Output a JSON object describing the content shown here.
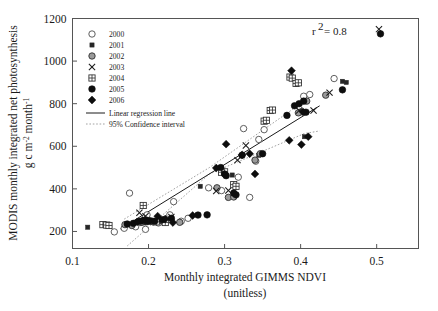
{
  "chart_data": {
    "type": "scatter",
    "title": "",
    "xlabel": "Monthly integrated GIMMS NDVI",
    "xlabel_sub": "(unitless)",
    "ylabel_line1": "MODIS monthly integrated net photosynthesis",
    "ylabel_line2": "g c m",
    "ylabel_exp1": "-2",
    "ylabel_line3": " month",
    "ylabel_exp2": "-1",
    "xlim": [
      0.1,
      0.555
    ],
    "ylim": [
      120,
      1200
    ],
    "xticks": [
      0.1,
      0.2,
      0.3,
      0.4,
      0.5
    ],
    "xticklabels": [
      "0.1",
      "0.2",
      "0.3",
      "0.4",
      "0.5"
    ],
    "yticks": [
      200,
      400,
      600,
      800,
      1000,
      1200
    ],
    "yticklabels": [
      "200",
      "400",
      "600",
      "800",
      "1000",
      "1200"
    ],
    "grid": false,
    "legend_position": "upper-left",
    "annotation": "r  = 0.8",
    "annotation_r": "r",
    "annotation_exp": "2",
    "annotation_eq": "= 0.8",
    "regression": {
      "label": "Linear regression line",
      "x0": 0.163,
      "y0": 212,
      "x1": 0.425,
      "y1": 790
    },
    "confidence": {
      "label": "95% Confidence interval",
      "upper": [
        [
          0.168,
          258
        ],
        [
          0.28,
          500
        ],
        [
          0.4,
          800
        ],
        [
          0.418,
          845
        ]
      ],
      "lower": [
        [
          0.172,
          132
        ],
        [
          0.28,
          470
        ],
        [
          0.405,
          660
        ],
        [
          0.425,
          672
        ]
      ]
    },
    "series": [
      {
        "name": "2000",
        "marker": "open-circle",
        "points": [
          [
            0.155,
            198
          ],
          [
            0.168,
            215
          ],
          [
            0.175,
            380
          ],
          [
            0.183,
            222
          ],
          [
            0.192,
            245
          ],
          [
            0.196,
            210
          ],
          [
            0.198,
            278
          ],
          [
            0.205,
            248
          ],
          [
            0.213,
            240
          ],
          [
            0.222,
            258
          ],
          [
            0.228,
            278
          ],
          [
            0.233,
            340
          ],
          [
            0.243,
            248
          ],
          [
            0.252,
            262
          ],
          [
            0.279,
            405
          ],
          [
            0.296,
            392
          ],
          [
            0.318,
            455
          ],
          [
            0.325,
            683
          ],
          [
            0.333,
            360
          ],
          [
            0.341,
            530
          ],
          [
            0.345,
            632
          ],
          [
            0.352,
            678
          ],
          [
            0.399,
            760
          ],
          [
            0.404,
            835
          ],
          [
            0.412,
            843
          ],
          [
            0.444,
            918
          ]
        ]
      },
      {
        "name": "2001",
        "marker": "small-square",
        "points": [
          [
            0.12,
            220
          ],
          [
            0.14,
            230
          ],
          [
            0.146,
            232
          ],
          [
            0.172,
            235
          ],
          [
            0.188,
            250
          ],
          [
            0.195,
            240
          ],
          [
            0.203,
            242
          ],
          [
            0.215,
            245
          ],
          [
            0.268,
            412
          ],
          [
            0.299,
            480
          ],
          [
            0.31,
            465
          ],
          [
            0.345,
            558
          ],
          [
            0.349,
            562
          ],
          [
            0.405,
            645
          ],
          [
            0.455,
            905
          ],
          [
            0.46,
            900
          ]
        ]
      },
      {
        "name": "2002",
        "marker": "gray-circle",
        "points": [
          [
            0.169,
            232
          ],
          [
            0.178,
            228
          ],
          [
            0.19,
            242
          ],
          [
            0.199,
            252
          ],
          [
            0.206,
            245
          ],
          [
            0.218,
            250
          ],
          [
            0.241,
            243
          ],
          [
            0.29,
            405
          ],
          [
            0.305,
            360
          ],
          [
            0.312,
            362
          ],
          [
            0.34,
            535
          ],
          [
            0.347,
            565
          ],
          [
            0.397,
            757
          ],
          [
            0.408,
            812
          ],
          [
            0.433,
            840
          ]
        ]
      },
      {
        "name": "2003",
        "marker": "cross",
        "points": [
          [
            0.188,
            288
          ],
          [
            0.196,
            272
          ],
          [
            0.23,
            268
          ],
          [
            0.289,
            390
          ],
          [
            0.305,
            392
          ],
          [
            0.317,
            535
          ],
          [
            0.328,
            604
          ],
          [
            0.398,
            768
          ],
          [
            0.417,
            768
          ],
          [
            0.438,
            852
          ],
          [
            0.503,
            1150
          ]
        ]
      },
      {
        "name": "2004",
        "marker": "crossed-square",
        "points": [
          [
            0.14,
            232
          ],
          [
            0.145,
            230
          ],
          [
            0.148,
            228
          ],
          [
            0.193,
            322
          ],
          [
            0.21,
            245
          ],
          [
            0.222,
            242
          ],
          [
            0.296,
            478
          ],
          [
            0.3,
            480
          ],
          [
            0.312,
            420
          ],
          [
            0.315,
            412
          ],
          [
            0.352,
            718
          ],
          [
            0.355,
            722
          ],
          [
            0.36,
            768
          ],
          [
            0.363,
            770
          ],
          [
            0.386,
            925
          ],
          [
            0.389,
            920
          ],
          [
            0.394,
            895
          ],
          [
            0.397,
            898
          ]
        ]
      },
      {
        "name": "2005",
        "marker": "filled-circle",
        "points": [
          [
            0.172,
            235
          ],
          [
            0.18,
            238
          ],
          [
            0.189,
            248
          ],
          [
            0.196,
            252
          ],
          [
            0.202,
            250
          ],
          [
            0.208,
            248
          ],
          [
            0.218,
            255
          ],
          [
            0.23,
            262
          ],
          [
            0.265,
            277
          ],
          [
            0.277,
            278
          ],
          [
            0.295,
            500
          ],
          [
            0.3,
            470
          ],
          [
            0.302,
            462
          ],
          [
            0.312,
            380
          ],
          [
            0.315,
            372
          ],
          [
            0.323,
            558
          ],
          [
            0.35,
            565
          ],
          [
            0.382,
            745
          ],
          [
            0.392,
            790
          ],
          [
            0.398,
            800
          ],
          [
            0.404,
            812
          ],
          [
            0.407,
            760
          ],
          [
            0.455,
            865
          ],
          [
            0.505,
            1128
          ]
        ]
      },
      {
        "name": "2006",
        "marker": "filled-diamond",
        "points": [
          [
            0.185,
            245
          ],
          [
            0.192,
            252
          ],
          [
            0.199,
            248
          ],
          [
            0.212,
            272
          ],
          [
            0.222,
            258
          ],
          [
            0.232,
            242
          ],
          [
            0.258,
            275
          ],
          [
            0.289,
            498
          ],
          [
            0.302,
            610
          ],
          [
            0.323,
            560
          ],
          [
            0.333,
            565
          ],
          [
            0.34,
            470
          ],
          [
            0.385,
            628
          ],
          [
            0.388,
            955
          ],
          [
            0.401,
            608
          ],
          [
            0.403,
            762
          ],
          [
            0.41,
            645
          ]
        ]
      }
    ],
    "legend_series": [
      {
        "label": "2000",
        "marker": "open-circle"
      },
      {
        "label": "2001",
        "marker": "small-square"
      },
      {
        "label": "2002",
        "marker": "gray-circle"
      },
      {
        "label": "2003",
        "marker": "cross"
      },
      {
        "label": "2004",
        "marker": "crossed-square"
      },
      {
        "label": "2005",
        "marker": "filled-circle"
      },
      {
        "label": "2006",
        "marker": "filled-diamond"
      }
    ],
    "legend_lines": [
      {
        "label": "Linear regression line",
        "style": "solid"
      },
      {
        "label": "95% Confidence interval",
        "style": "dotted"
      }
    ]
  }
}
